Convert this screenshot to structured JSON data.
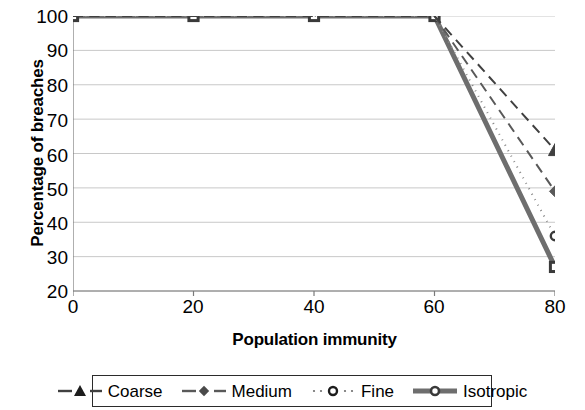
{
  "chart_data": {
    "type": "line",
    "title": "",
    "xlabel": "Population immunity",
    "ylabel": "Percentage of breaches",
    "x": [
      0,
      20,
      40,
      60,
      80
    ],
    "xlim": [
      0,
      80
    ],
    "ylim": [
      20,
      100
    ],
    "xticks": [
      "0",
      "20",
      "40",
      "60",
      "80"
    ],
    "yticks": [
      "100",
      "90",
      "80",
      "70",
      "60",
      "50",
      "40",
      "30",
      "20"
    ],
    "grid": true,
    "grid_axis": "y",
    "legend_position": "bottom",
    "series": [
      {
        "name": "Coarse",
        "values": [
          100,
          100,
          100,
          100,
          61
        ],
        "marker": "triangle",
        "line_style": "dashed",
        "color": "#404040",
        "width": 2
      },
      {
        "name": "Medium",
        "values": [
          100,
          100,
          100,
          100,
          49
        ],
        "marker": "diamond",
        "line_style": "dashed",
        "color": "#595959",
        "width": 2
      },
      {
        "name": "Fine",
        "values": [
          100,
          100,
          100,
          100,
          36
        ],
        "marker": "circle-open",
        "line_style": "dotted",
        "color": "#8a8a8a",
        "width": 2
      },
      {
        "name": "Isotropic",
        "values": [
          100,
          100,
          100,
          100,
          27
        ],
        "marker": "square",
        "line_style": "solid",
        "color": "#6e6e6e",
        "width": 5
      }
    ]
  },
  "legend": {
    "items": [
      {
        "label": "Coarse"
      },
      {
        "label": "Medium"
      },
      {
        "label": "Fine"
      },
      {
        "label": "Isotropic"
      }
    ]
  },
  "colors": {
    "axis": "#7a7a7a",
    "grid": "#c8c8c8",
    "text": "#000000",
    "legend_border": "#2b2b2b"
  }
}
